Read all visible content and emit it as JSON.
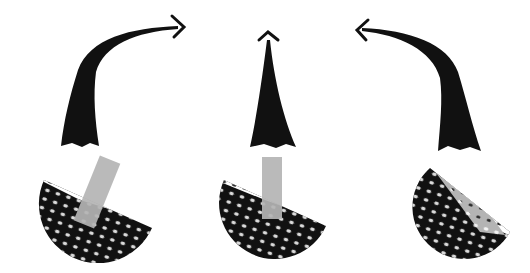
{
  "diagram": {
    "colors": {
      "ink": "#111111",
      "ball_white": "#ffffff",
      "clubface_grey": "#b4b4b4",
      "background": "#ffffff"
    },
    "shots": [
      {
        "id": "left",
        "curve_direction": "right",
        "arrow_icon": "arrow-right-icon",
        "clubface_angle_deg": 22
      },
      {
        "id": "center",
        "curve_direction": "straight",
        "arrow_icon": "arrow-up-icon",
        "clubface_angle_deg": 0
      },
      {
        "id": "right",
        "curve_direction": "left",
        "arrow_icon": "arrow-left-icon",
        "clubface_angle_deg": -28
      }
    ]
  }
}
